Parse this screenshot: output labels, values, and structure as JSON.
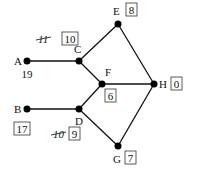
{
  "diagram": {
    "type": "network-graph",
    "nodes": [
      {
        "id": "A",
        "label": "A",
        "value": "19",
        "boxed": false,
        "struck_value": null
      },
      {
        "id": "B",
        "label": "B",
        "value": "17",
        "boxed": true,
        "struck_value": null
      },
      {
        "id": "C",
        "label": "C",
        "value": "10",
        "boxed": true,
        "struck_value": "11"
      },
      {
        "id": "D",
        "label": "D",
        "value": "9",
        "boxed": true,
        "struck_value": "10"
      },
      {
        "id": "E",
        "label": "E",
        "value": "8",
        "boxed": true,
        "struck_value": null
      },
      {
        "id": "F",
        "label": "F",
        "value": "6",
        "boxed": true,
        "struck_value": null
      },
      {
        "id": "G",
        "label": "G",
        "value": "7",
        "boxed": true,
        "struck_value": null
      },
      {
        "id": "H",
        "label": "H",
        "value": "0",
        "boxed": true,
        "struck_value": null
      }
    ],
    "edges": [
      {
        "from": "A",
        "to": "C"
      },
      {
        "from": "C",
        "to": "E"
      },
      {
        "from": "C",
        "to": "F"
      },
      {
        "from": "E",
        "to": "H"
      },
      {
        "from": "F",
        "to": "H"
      },
      {
        "from": "B",
        "to": "D"
      },
      {
        "from": "D",
        "to": "F"
      },
      {
        "from": "D",
        "to": "G"
      },
      {
        "from": "G",
        "to": "H"
      }
    ]
  }
}
